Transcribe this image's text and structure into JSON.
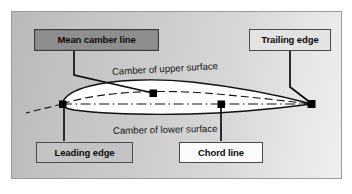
{
  "figure": {
    "background_gradient_from": "#b9b9b9",
    "background_gradient_to": "#efefef",
    "frame_color": "#9a9a9a"
  },
  "labels": {
    "mean_camber_line": "Mean camber line",
    "trailing_edge": "Trailing edge",
    "leading_edge": "Leading edge",
    "chord_line": "Chord line"
  },
  "label_colors": {
    "mean_camber_line_fill": "#8e8e8e",
    "trailing_edge_fill": "#e3e3e3",
    "leading_edge_fill": "#c3c3c3",
    "chord_line_fill": "#fbfbfb",
    "box_border": "#4a4a4a",
    "text": "#0b0b0b"
  },
  "captions": {
    "upper_surface": "Camber of upper surface",
    "lower_surface": "Camber of lower surface"
  },
  "airfoil": {
    "fill": "#ffffff",
    "outline": "#111111",
    "marker_color": "#000000",
    "chord_line_style": "dash-dot",
    "mean_camber_line_style": "dashed"
  }
}
